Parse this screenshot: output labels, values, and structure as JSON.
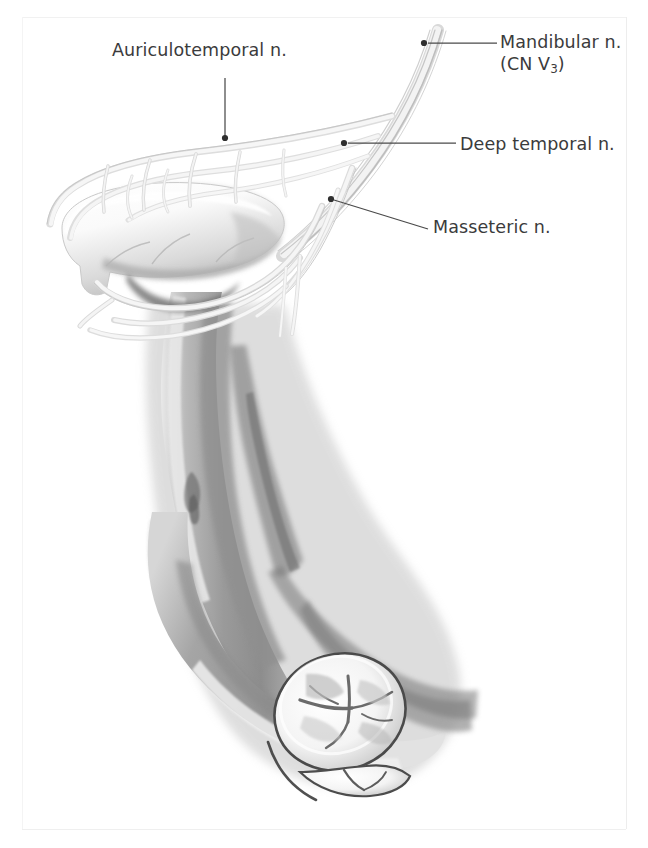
{
  "figure": {
    "background_color": "#ffffff",
    "label_color": "#3b3b3c",
    "leader_color": "#4a4a4a"
  },
  "labels": {
    "auriculotemporal": "Auriculotemporal n.",
    "mandibular_line1": "Mandibular n.",
    "mandibular_line2_prefix": "(CN V",
    "mandibular_line2_sub": "3",
    "mandibular_line2_suffix": ")",
    "deep_temporal": "Deep temporal n.",
    "masseteric": "Masseteric n."
  },
  "leaders": [
    {
      "name": "auriculotemporal",
      "from": [
        225,
        78
      ],
      "to": [
        225,
        138
      ],
      "dot": [
        225,
        138
      ]
    },
    {
      "name": "mandibular",
      "from": [
        497,
        43
      ],
      "to": [
        424,
        43
      ],
      "dot": [
        424,
        43
      ]
    },
    {
      "name": "deep-temporal",
      "from": [
        456,
        143
      ],
      "to": [
        344,
        143
      ],
      "dot": [
        344,
        143
      ]
    },
    {
      "name": "masseteric",
      "from": [
        428,
        229
      ],
      "to": [
        331,
        199
      ],
      "dot": [
        331,
        199
      ]
    }
  ],
  "structures": [
    {
      "name": "mandibular-nerve-trunk",
      "type": "nerve-bundle"
    },
    {
      "name": "deep-temporal-nerves",
      "type": "nerve-branches"
    },
    {
      "name": "masseteric-nerve",
      "type": "nerve-branch"
    },
    {
      "name": "auriculotemporal-nerve",
      "type": "nerve-branch"
    },
    {
      "name": "coronoid-process",
      "type": "bone"
    },
    {
      "name": "mandibular-ramus",
      "type": "bone"
    },
    {
      "name": "mandibular-body",
      "type": "bone"
    },
    {
      "name": "third-molar",
      "type": "tooth"
    },
    {
      "name": "second-molar",
      "type": "tooth"
    }
  ]
}
